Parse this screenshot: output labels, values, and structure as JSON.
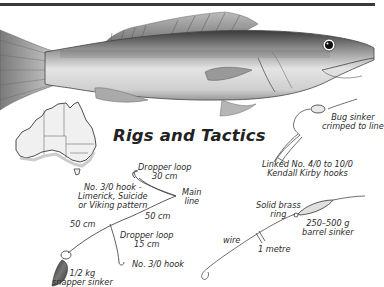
{
  "title": "Rigs and Tactics",
  "illustration": {
    "fish": "fish-illustration",
    "map": "australia-map"
  },
  "labels": {
    "bug_sinker": [
      "Bug sinker",
      "crimped to line"
    ],
    "linked_hooks": [
      "Linked No. 4/0 to 10/0",
      "Kendall Kirby hooks"
    ],
    "dropper_loop_30": [
      "Dropper loop",
      "30 cm"
    ],
    "hook_pattern": [
      "No. 3/0 hook -",
      "Limerick, Suicide",
      "or Viking pattern"
    ],
    "main_line": [
      "Main",
      "line"
    ],
    "dist_50_left": "50 cm",
    "dist_50_right": "50 cm",
    "dropper_loop_15": [
      "Dropper loop",
      "15 cm"
    ],
    "hook_3_0": "No. 3/0 hook",
    "snapper_sinker": [
      "1/2 kg",
      "snapper sinker"
    ],
    "brass_ring": [
      "Solid brass",
      "ring"
    ],
    "barrel_sinker": [
      "250–500 g",
      "barrel sinker"
    ],
    "wire": "wire",
    "one_metre": "1 metre"
  },
  "colors": {
    "line": "#4a4a4a",
    "text": "#2a2a2a",
    "border": "#3a3a3a"
  }
}
